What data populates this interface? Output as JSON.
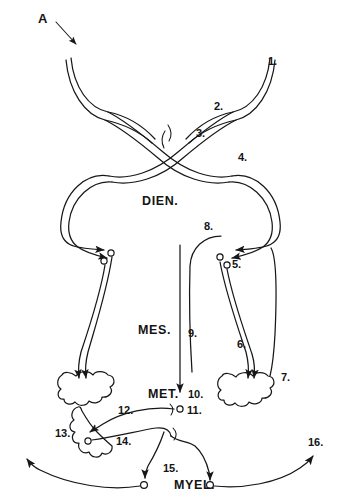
{
  "figure": {
    "panel_letter": "A",
    "region_labels": [
      {
        "id": "dien",
        "text": "DIEN.",
        "x": 142,
        "y": 205
      },
      {
        "id": "mes",
        "text": "MES.",
        "x": 138,
        "y": 334
      },
      {
        "id": "met",
        "text": "MET.",
        "x": 148,
        "y": 398
      },
      {
        "id": "myel",
        "text": "MYEL.",
        "x": 174,
        "y": 489
      }
    ],
    "reference_numbers": [
      {
        "id": "ref-1",
        "text": "1.",
        "x": 268,
        "y": 65
      },
      {
        "id": "ref-2",
        "text": "2.",
        "x": 214,
        "y": 110
      },
      {
        "id": "ref-3",
        "text": "3.",
        "x": 196,
        "y": 137
      },
      {
        "id": "ref-4",
        "text": "4.",
        "x": 238,
        "y": 161
      },
      {
        "id": "ref-5",
        "text": "5.",
        "x": 227,
        "y": 263
      },
      {
        "id": "ref-6",
        "text": "6.",
        "x": 237,
        "y": 348
      },
      {
        "id": "ref-7",
        "text": "7.",
        "x": 277,
        "y": 381
      },
      {
        "id": "ref-8",
        "text": "8.",
        "x": 204,
        "y": 230
      },
      {
        "id": "ref-9",
        "text": "9.",
        "x": 190,
        "y": 335
      },
      {
        "id": "ref-10",
        "text": "10.",
        "x": 190,
        "y": 398
      },
      {
        "id": "ref-11",
        "text": "11.",
        "x": 190,
        "y": 414
      },
      {
        "id": "ref-12",
        "text": "12.",
        "x": 119,
        "y": 412
      },
      {
        "id": "ref-13",
        "text": "13.",
        "x": 57,
        "y": 437
      },
      {
        "id": "ref-14",
        "text": "14.",
        "x": 117,
        "y": 443
      },
      {
        "id": "ref-15",
        "text": "15.",
        "x": 166,
        "y": 472
      },
      {
        "id": "ref-16",
        "text": "16.",
        "x": 311,
        "y": 446
      }
    ]
  },
  "colors": {
    "ink": "#17171a",
    "background": "#ffffff"
  }
}
